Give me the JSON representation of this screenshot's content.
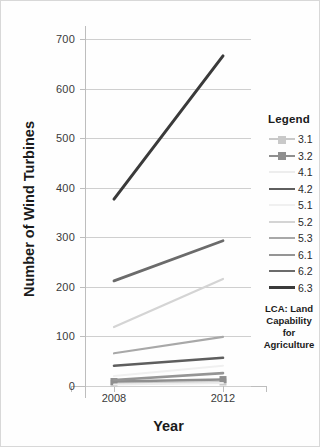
{
  "chart_data": {
    "type": "line",
    "title": "",
    "xlabel": "Year",
    "ylabel": "Number of Wind Turbines",
    "x": [
      "2008",
      "2012"
    ],
    "categories": [
      "2008",
      "2012"
    ],
    "ylim": [
      0,
      700
    ],
    "yticks": [
      0,
      100,
      200,
      300,
      400,
      500,
      600,
      700
    ],
    "ytick_labels": [
      "0",
      "100",
      "200",
      "300",
      "400",
      "500",
      "600",
      "700"
    ],
    "grid": true,
    "legend_position": "right",
    "series": [
      {
        "name": "3.1",
        "values": [
          5,
          8
        ],
        "color": "#c9c9c9",
        "width": 2.0,
        "marker": true
      },
      {
        "name": "3.2",
        "values": [
          9,
          13
        ],
        "color": "#8f8f8f",
        "width": 2.4,
        "marker": true
      },
      {
        "name": "4.1",
        "values": [
          3,
          6
        ],
        "color": "#ededed",
        "width": 2.0,
        "marker": false
      },
      {
        "name": "4.2",
        "values": [
          41,
          57
        ],
        "color": "#5e5e5e",
        "width": 2.6,
        "marker": false
      },
      {
        "name": "5.1",
        "values": [
          20,
          41
        ],
        "color": "#f0f0f0",
        "width": 2.0,
        "marker": false
      },
      {
        "name": "5.2",
        "values": [
          119,
          216
        ],
        "color": "#d4d4d4",
        "width": 2.2,
        "marker": false
      },
      {
        "name": "5.3",
        "values": [
          66,
          99
        ],
        "color": "#a8a8a8",
        "width": 2.2,
        "marker": false
      },
      {
        "name": "6.1",
        "values": [
          12,
          26
        ],
        "color": "#959595",
        "width": 2.6,
        "marker": false
      },
      {
        "name": "6.2",
        "values": [
          212,
          293
        ],
        "color": "#6b6b6b",
        "width": 2.8,
        "marker": false
      },
      {
        "name": "6.3",
        "values": [
          377,
          666
        ],
        "color": "#3a3a3a",
        "width": 3.0,
        "marker": false
      }
    ]
  },
  "legend": {
    "title": "Legend",
    "caption": "LCA: Land Capability for Agriculture",
    "caption_lines": [
      "LCA: Land",
      "Capability",
      "for",
      "Agriculture"
    ]
  },
  "axes": {
    "y_title": "Number of Wind Turbines",
    "x_title": "Year",
    "y_ticks": [
      "700",
      "600",
      "500",
      "400",
      "300",
      "200",
      "100",
      "0"
    ],
    "x_ticks": [
      "2008",
      "2012"
    ]
  },
  "colors": {
    "grid": "#cfcfcf",
    "axis": "#bdbdbd",
    "text": "#1a1a1a",
    "background": "#fefefe"
  }
}
